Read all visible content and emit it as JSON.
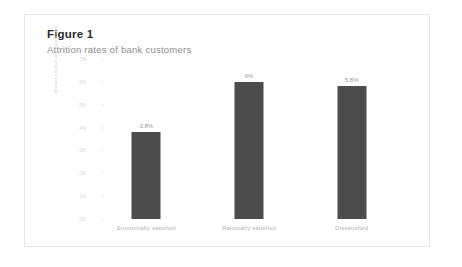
{
  "figure": {
    "title": "Figure 1",
    "subtitle": "Attrition rates of bank customers"
  },
  "chart_data": {
    "type": "bar",
    "title": "Attrition rates of bank customers",
    "xlabel": "",
    "ylabel": "Annual attrition per customers",
    "categories": [
      "Emotionally satisfied",
      "Rationally satisfied",
      "Dissatisfied"
    ],
    "values": [
      3.8,
      6.0,
      5.8
    ],
    "value_labels": [
      "3.8%",
      "6%",
      "5.8%"
    ],
    "ylim": [
      0,
      7
    ],
    "yticks": [
      0,
      1,
      2,
      3,
      4,
      5,
      6,
      7
    ],
    "ytick_labels": [
      "0%",
      "1%",
      "2%",
      "3%",
      "4%",
      "5%",
      "6%",
      "7%"
    ],
    "grid": false,
    "legend": "none",
    "bar_color": "#4c4c4c"
  }
}
